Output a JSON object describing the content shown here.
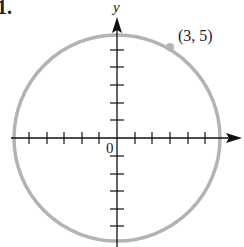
{
  "problem_number": "1.",
  "axes": {
    "x_label": "",
    "y_label": "y",
    "origin_label": "0",
    "x_ticks": [
      -5,
      -4,
      -3,
      -2,
      -1,
      1,
      2,
      3,
      4,
      5
    ],
    "y_ticks": [
      -5,
      -4,
      -3,
      -2,
      -1,
      1,
      2,
      3,
      4,
      5
    ]
  },
  "circle": {
    "center": [
      0,
      0
    ],
    "point": [
      3,
      5
    ],
    "point_label": "(3, 5)",
    "color": "#b3b3b3"
  },
  "colors": {
    "axis": "#111111",
    "circle": "#b3b3b3",
    "point": "#b3b3b3",
    "text": "#222222"
  }
}
